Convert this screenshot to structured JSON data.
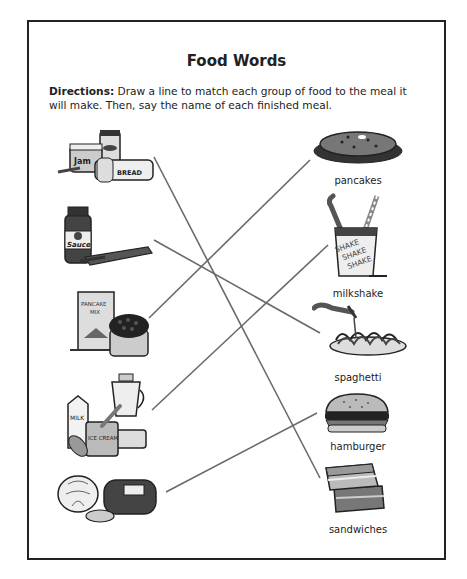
{
  "worksheet": {
    "title": "Food Words",
    "directions_label": "Directions:",
    "directions_text": " Draw a line to match each group of food to the meal it will make. Then, say the name of each finished meal."
  },
  "ingredient_groups": [
    {
      "id": "jam-peanutbutter-bread",
      "icon": "jam-jar-peanut-butter-bread-icon",
      "labels": [
        "Jam",
        "BREAD"
      ]
    },
    {
      "id": "sauce-pasta",
      "icon": "sauce-jar-pasta-box-icon",
      "labels": [
        "Sauce"
      ]
    },
    {
      "id": "pancake-mix-berries",
      "icon": "pancake-mix-box-berries-icon",
      "labels": [
        "PANCAKE MIX"
      ]
    },
    {
      "id": "milk-icecream-blender",
      "icon": "milk-icecream-blender-icon",
      "labels": [
        "MILK",
        "ICE CREAM"
      ]
    },
    {
      "id": "lettuce-meat-bun",
      "icon": "lettuce-meat-bun-icon",
      "labels": []
    }
  ],
  "meals": [
    {
      "id": "pancakes",
      "label": "pancakes",
      "icon": "pancakes-icon"
    },
    {
      "id": "milkshake",
      "label": "milkshake",
      "icon": "milkshake-cup-icon",
      "cup_text": [
        "SHAKE",
        "SHAKE",
        "SHAKE"
      ]
    },
    {
      "id": "spaghetti",
      "label": "spaghetti",
      "icon": "spaghetti-plate-icon"
    },
    {
      "id": "hamburger",
      "label": "hamburger",
      "icon": "hamburger-icon"
    },
    {
      "id": "sandwiches",
      "label": "sandwiches",
      "icon": "sandwiches-icon"
    }
  ],
  "matching_lines": [
    {
      "from": "jam-peanutbutter-bread",
      "to": "sandwiches",
      "x1": 154,
      "y1": 157,
      "x2": 320,
      "y2": 478
    },
    {
      "from": "sauce-pasta",
      "to": "spaghetti",
      "x1": 154,
      "y1": 240,
      "x2": 320,
      "y2": 333
    },
    {
      "from": "pancake-mix-berries",
      "to": "pancakes",
      "x1": 149,
      "y1": 318,
      "x2": 310,
      "y2": 160
    },
    {
      "from": "milk-icecream-blender",
      "to": "milkshake",
      "x1": 152,
      "y1": 410,
      "x2": 328,
      "y2": 245
    },
    {
      "from": "lettuce-meat-bun",
      "to": "hamburger",
      "x1": 166,
      "y1": 492,
      "x2": 317,
      "y2": 413
    }
  ],
  "colors": {
    "line": "#6a6a6a",
    "ink": "#222222",
    "border": "#222222"
  }
}
